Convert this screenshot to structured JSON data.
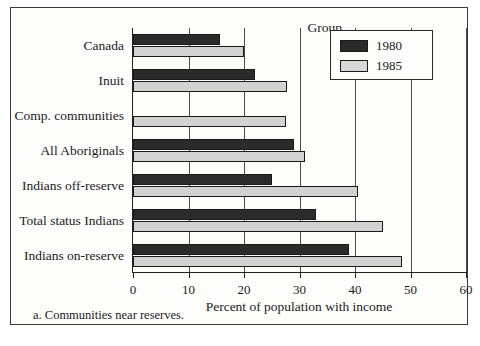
{
  "figure": {
    "group_header": "Group",
    "footnote": "a.  Communities near reserves."
  },
  "legend": {
    "items": [
      {
        "label": "1980",
        "color": "#2b2b2b"
      },
      {
        "label": "1985",
        "color": "#d7d7d7"
      }
    ]
  },
  "chart_data": {
    "type": "bar",
    "orientation": "horizontal",
    "title": "",
    "xlabel": "Percent of population with income",
    "ylabel": "Group",
    "xlim": [
      0,
      60
    ],
    "xticks": [
      0,
      10,
      20,
      30,
      40,
      50,
      60
    ],
    "xticklabels": [
      "0",
      "10",
      "20",
      "30",
      "40",
      "50",
      "60"
    ],
    "grid": true,
    "legend_position": "top-right",
    "categories": [
      "Canada",
      "Inuit",
      "Comp. communities",
      "All Aboriginals",
      "Indians off-reserve",
      "Total status Indians",
      "Indians on-reserve"
    ],
    "series": [
      {
        "name": "1980",
        "color": "#2b2b2b",
        "values": [
          15.7,
          22.0,
          null,
          29.0,
          25.0,
          33.0,
          39.0
        ]
      },
      {
        "name": "1985",
        "color": "#d2d2d2",
        "values": [
          20.0,
          27.7,
          27.5,
          31.0,
          40.5,
          45.0,
          48.4
        ]
      }
    ],
    "notes": [
      "a.  Communities near reserves."
    ]
  }
}
